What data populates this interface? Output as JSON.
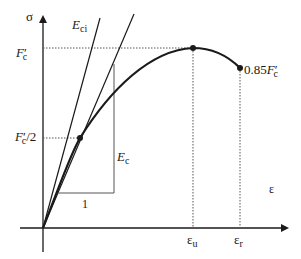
{
  "diagram": {
    "colors": {
      "line": "#1a1a1a",
      "dotted": "#555555",
      "background": "#ffffff"
    },
    "axes": {
      "y_label": "σ",
      "x_label": "ε"
    },
    "labels": {
      "eci": {
        "main": "E",
        "sub": "ci"
      },
      "ec": {
        "main": "E",
        "sub": "c"
      },
      "fc_peak": {
        "main": "F",
        "prime": "′",
        "sub": "c"
      },
      "fc_half": {
        "main": "F",
        "prime": "′",
        "sub": "c",
        "suffix": "/2"
      },
      "fc_end": {
        "prefix": "0.85",
        "main": "F",
        "prime": "′",
        "sub": "c"
      },
      "unit_run": "1",
      "eps_u": {
        "main": "ε",
        "sub": "u"
      },
      "eps_r": {
        "main": "ε",
        "sub": "r"
      }
    },
    "geometry": {
      "origin": [
        43,
        228
      ],
      "peak_point": [
        193,
        48
      ],
      "end_point": [
        240,
        68
      ],
      "half_point": [
        80,
        138
      ],
      "eci_line_end": [
        100,
        18
      ],
      "secant_line_end": [
        134,
        14
      ],
      "slope_triangle": {
        "x_left": 57,
        "x_right": 114,
        "y_top": 64,
        "y_bottom": 193
      }
    }
  }
}
